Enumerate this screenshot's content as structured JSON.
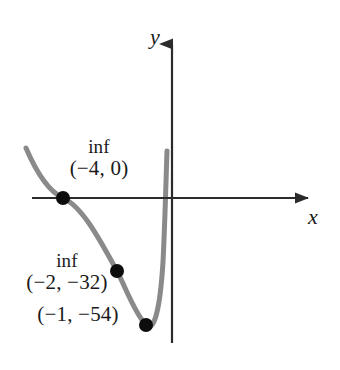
{
  "figure": {
    "name": "polynomial-curve-graph",
    "background_color": "#ffffff"
  },
  "axes": {
    "x_label": "x",
    "y_label": "y",
    "line_color": "#2b2b2b",
    "x_axis": {
      "y_px": 198,
      "x_start_px": 32,
      "x_end_px": 320
    },
    "y_axis": {
      "x_px": 172,
      "y_start_px": 30,
      "y_end_px": 343
    }
  },
  "curve": {
    "color": "#8a8a8a",
    "width_px": 5,
    "path": "M 26 148 C 38 176, 50 192, 63 198 C 82 206, 100 240, 117 271 C 126 288, 134 312, 146 325 C 154 333, 160 310, 163 262 C 165 222, 166 180, 167 151"
  },
  "points": [
    {
      "id": "point-a",
      "dot_px": {
        "x": 63,
        "y": 198
      },
      "radius_px": 7,
      "color": "#0d0d0d",
      "inf_label": "inf",
      "coordinates": "(−4, 0)",
      "x_value": -4,
      "y_value": 0
    },
    {
      "id": "point-b",
      "dot_px": {
        "x": 117,
        "y": 271
      },
      "radius_px": 7,
      "color": "#0d0d0d",
      "inf_label": "inf",
      "coordinates": "(−2, −32)",
      "x_value": -2,
      "y_value": -32
    },
    {
      "id": "point-c",
      "dot_px": {
        "x": 146,
        "y": 325
      },
      "radius_px": 7,
      "color": "#0d0d0d",
      "inf_label": "",
      "coordinates": "(−1, −54)",
      "x_value": -1,
      "y_value": -54
    }
  ],
  "chart_data": {
    "type": "line",
    "title": "",
    "xlabel": "x",
    "ylabel": "y",
    "grid": false,
    "legend": null,
    "series": [
      {
        "name": "curve",
        "color": "#8a8a8a",
        "description": "Polynomial curve falling from upper left, crossing the x-axis at x = -4, reaching a minimum at (-1, -54), then rising steeply across the y-axis"
      }
    ],
    "annotated_points": [
      {
        "label": "inf",
        "x": -4,
        "y": 0,
        "text": "(−4, 0)"
      },
      {
        "label": "inf",
        "x": -2,
        "y": -32,
        "text": "(−2, −32)"
      },
      {
        "label": "",
        "x": -1,
        "y": -54,
        "text": "(−1, −54)"
      }
    ]
  }
}
